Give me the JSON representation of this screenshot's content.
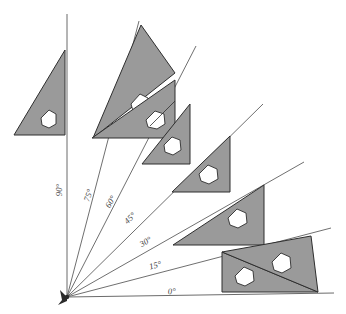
{
  "diagram": {
    "origin": {
      "x": 67,
      "y": 297,
      "label": "origin-vertex"
    },
    "fill_color": "#9a9a9a",
    "outline_color": "#2e2e2e",
    "ray_color": "#4a4a4a",
    "background_color": "#ffffff",
    "degree_symbol": "°",
    "angles": [
      {
        "id": "ray-0",
        "label": "0°",
        "degrees": 0,
        "label_x": 170,
        "label_y": 294,
        "label_rotation": -3,
        "ray_end_x": 334,
        "ray_end_y": 293,
        "triangle": "set-square-0"
      },
      {
        "id": "ray-15",
        "label": "15°",
        "degrees": 15,
        "label_x": 153,
        "label_y": 268,
        "label_rotation": -15,
        "ray_end_x": 331,
        "ray_end_y": 228,
        "triangle": "set-square-15"
      },
      {
        "id": "ray-30",
        "label": "30°",
        "degrees": 30,
        "label_x": 144,
        "label_y": 243,
        "label_rotation": -32,
        "ray_end_x": 304,
        "ray_end_y": 162,
        "triangle": "set-square-30"
      },
      {
        "id": "ray-45",
        "label": "45°",
        "degrees": 45,
        "label_x": 130,
        "label_y": 219,
        "label_rotation": -45,
        "ray_end_x": 263,
        "ray_end_y": 104,
        "triangle": "set-square-45"
      },
      {
        "id": "ray-60",
        "label": "60°",
        "degrees": 60,
        "label_x": 111,
        "label_y": 203,
        "label_rotation": -60,
        "ray_end_x": 196,
        "ray_end_y": 46,
        "triangle": "set-square-60"
      },
      {
        "id": "ray-75",
        "label": "75°",
        "degrees": 75,
        "label_x": 91,
        "label_y": 196,
        "label_rotation": -72,
        "ray_end_x": 139,
        "ray_end_y": 21,
        "triangle": "set-square-75"
      },
      {
        "id": "ray-90",
        "label": "90°",
        "degrees": 90,
        "label_x": 62,
        "label_y": 190,
        "label_rotation": -90,
        "ray_end_x": 67,
        "ray_end_y": 14,
        "triangle": "set-square-90"
      }
    ],
    "set_squares": [
      {
        "id": "set-square-90",
        "angle": 90,
        "body_points": "14,135 65,135 65,50",
        "hole_points": "41,118 53,111 56,119 51,127 43,127",
        "name": "set-square-90"
      },
      {
        "id": "set-square-75",
        "angle": 75,
        "body_points": "93,138 174,74 142,25",
        "hole_points": "130,104 143,94 150,102 145,113 135,114",
        "name": "set-square-75"
      },
      {
        "id": "set-square-60",
        "angle": 60,
        "body_points": "99,126 188,126 188,69",
        "hole_points": "156,100 170,94 174,102 168,112 159,111",
        "name": "set-square-60"
      },
      {
        "id": "set-square-45",
        "angle": 45,
        "body_points": "142,160 192,160 192,105",
        "hole_points": "167,136 180,130 183,139 177,147 169,146",
        "name": "set-square-45"
      },
      {
        "id": "set-square-45b",
        "angle": 45,
        "body_points": "172,190 231,190 231,135",
        "hole_points": "199,166 212,160 216,169 209,177 201,176",
        "name": "set-square-45-lower"
      },
      {
        "id": "set-square-30",
        "angle": 30,
        "body_points": "173,244 264,244 264,184",
        "hole_points": "229,213 244,207 248,216 241,226 231,224",
        "name": "set-square-30"
      },
      {
        "id": "set-square-15",
        "angle": 15,
        "body_points": "225,248 310,236 330,289",
        "hole_points": "272,264 287,258 291,268 284,277 275,275",
        "name": "set-square-15"
      },
      {
        "id": "set-square-0",
        "angle": 0,
        "body_points": "222,252 222,291 320,291",
        "hole_points": "237,273 252,266 256,275 249,284 240,282",
        "name": "set-square-0"
      }
    ]
  }
}
